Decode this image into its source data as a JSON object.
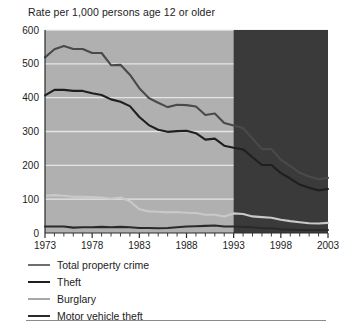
{
  "chart_data": {
    "type": "line",
    "title": "Rate per 1,000 persons age 12 or older",
    "subtitle": "",
    "xlabel": "",
    "ylabel": "",
    "xlim": [
      1973,
      2003
    ],
    "ylim": [
      0,
      600
    ],
    "yticks": [
      0,
      100,
      200,
      300,
      400,
      500,
      600
    ],
    "xticks": [
      1973,
      1978,
      1983,
      1988,
      1993,
      1998,
      2003
    ],
    "xtick_labels": [
      "1973",
      "1978",
      "1983",
      "1988",
      "1993",
      "1998",
      "2003"
    ],
    "ytick_labels": [
      "0",
      "100",
      "200",
      "300",
      "400",
      "500",
      "600"
    ],
    "grid": "horizontal",
    "legend_position": "below",
    "plot_background": "#b0b0b0",
    "shaded_region": {
      "from": 1993,
      "to": 2003,
      "color": "#3a3a3a",
      "label": ""
    },
    "x": [
      1973,
      1974,
      1975,
      1976,
      1977,
      1978,
      1979,
      1980,
      1981,
      1982,
      1983,
      1984,
      1985,
      1986,
      1987,
      1988,
      1989,
      1990,
      1991,
      1992,
      1993,
      1994,
      1995,
      1996,
      1997,
      1998,
      1999,
      2000,
      2001,
      2002,
      2003
    ],
    "series": [
      {
        "name": "Total property crime",
        "color": "#4a4a4a",
        "values": [
          519,
          543,
          553,
          544,
          544,
          532,
          532,
          496,
          497,
          468,
          428,
          399,
          385,
          372,
          379,
          378,
          374,
          349,
          353,
          325,
          318,
          310,
          279,
          248,
          248,
          217,
          198,
          178,
          167,
          159,
          163
        ]
      },
      {
        "name": "Theft",
        "color": "#1f1f1f",
        "values": [
          407,
          423,
          423,
          420,
          420,
          413,
          408,
          395,
          388,
          375,
          343,
          319,
          305,
          299,
          301,
          302,
          295,
          276,
          279,
          258,
          252,
          247,
          224,
          201,
          201,
          177,
          161,
          143,
          134,
          126,
          130
        ]
      },
      {
        "name": "Burglary",
        "color": "#c9c9c9",
        "values": [
          110,
          112,
          110,
          107,
          107,
          106,
          105,
          101,
          105,
          94,
          70,
          64,
          63,
          61,
          62,
          60,
          59,
          54,
          54,
          49,
          58,
          56,
          49,
          47,
          45,
          39,
          35,
          32,
          29,
          28,
          30
        ]
      },
      {
        "name": "Motor vehicle theft",
        "color": "#2a2a2a",
        "values": [
          19,
          19,
          19,
          16,
          17,
          17,
          18,
          17,
          18,
          17,
          15,
          15,
          14,
          15,
          17,
          19,
          20,
          21,
          22,
          19,
          19,
          18,
          17,
          14,
          14,
          11,
          10,
          9,
          9,
          9,
          9
        ]
      }
    ]
  },
  "legend": {
    "items": [
      {
        "label": "Total property crime",
        "color": "#6e6e6e"
      },
      {
        "label": "Theft",
        "color": "#1f1f1f"
      },
      {
        "label": "Burglary",
        "color": "#a8a8a8"
      },
      {
        "label": "Motor vehicle theft",
        "color": "#2a2a2a"
      }
    ]
  }
}
